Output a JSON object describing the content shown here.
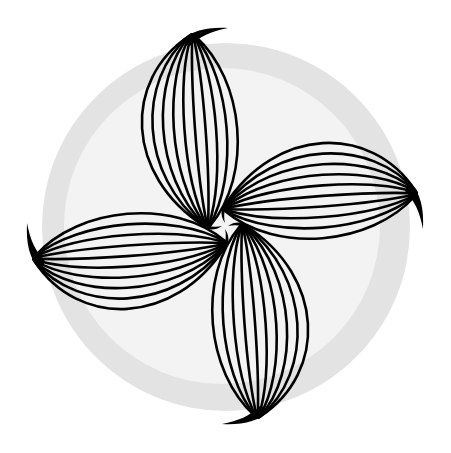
{
  "illustration": {
    "subject": "four-petal pinwheel of striped leaf shapes",
    "petal_count": 4,
    "lines_per_petal": 10,
    "colors": {
      "background": "#ffffff",
      "outer_ring": "#e3e3e3",
      "inner_disc": "#f3f3f3",
      "stroke": "#000000"
    },
    "circle": {
      "cx": 226,
      "cy": 227,
      "outer_r": 184,
      "inner_r": 158
    },
    "rotation_center": {
      "x": 225,
      "y": 226
    }
  }
}
